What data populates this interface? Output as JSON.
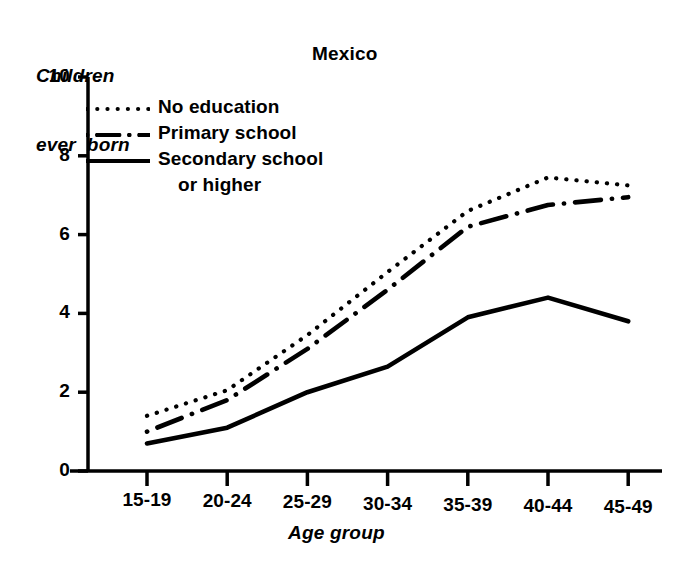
{
  "chart_data": {
    "type": "line",
    "title": "Mexico",
    "xlabel": "Age group",
    "ylabel": "Children ever born",
    "ylabel_line1": "Children",
    "ylabel_line2": "ever  born",
    "categories": [
      "15-19",
      "20-24",
      "25-29",
      "30-34",
      "35-39",
      "40-44",
      "45-49"
    ],
    "ylim": [
      0,
      10
    ],
    "yticks": [
      "0",
      "2",
      "4",
      "6",
      "8",
      "10"
    ],
    "ytick_values": [
      0,
      2,
      4,
      6,
      8,
      10
    ],
    "grid": false,
    "legend_position": "upper left",
    "series": [
      {
        "name": "No education",
        "style": "dotted",
        "values": [
          1.4,
          2.05,
          3.45,
          5.05,
          6.6,
          7.45,
          7.25
        ]
      },
      {
        "name": "Primary school",
        "style": "dash-dot",
        "values": [
          1.0,
          1.8,
          3.1,
          4.6,
          6.2,
          6.75,
          6.95
        ]
      },
      {
        "name": "Secondary school or higher",
        "style": "solid",
        "values": [
          0.7,
          1.1,
          2.0,
          2.65,
          3.9,
          4.4,
          3.8
        ]
      }
    ]
  },
  "legend": {
    "items": [
      {
        "label": "No education",
        "label2": ""
      },
      {
        "label": "Primary school",
        "label2": ""
      },
      {
        "label": "Secondary school",
        "label2": "or higher"
      }
    ]
  },
  "colors": {
    "ink": "#000000",
    "background": "#ffffff"
  }
}
